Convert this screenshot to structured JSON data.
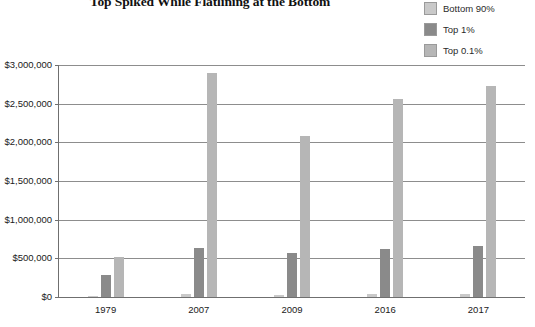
{
  "chart_data": {
    "type": "bar",
    "title": "Top Spiked While Flatlining at the Bottom",
    "xlabel": "",
    "ylabel": "",
    "categories": [
      "1979",
      "2007",
      "2009",
      "2016",
      "2017"
    ],
    "series": [
      {
        "name": "Bottom 90%",
        "color": "#c9c9c9",
        "values": [
          17000,
          34000,
          32000,
          37000,
          39000
        ]
      },
      {
        "name": "Top 1%",
        "color": "#8a8a8a",
        "values": [
          290000,
          630000,
          570000,
          620000,
          660000
        ]
      },
      {
        "name": "Top 0.1%",
        "color": "#b6b6b6",
        "values": [
          520000,
          2900000,
          2080000,
          2560000,
          2730000
        ]
      }
    ],
    "ylim": [
      0,
      3000000
    ],
    "ytick_labels": [
      "$0",
      "$500,000",
      "$1,000,000",
      "$1,500,000",
      "$2,000,000",
      "$2,500,000",
      "$3,000,000"
    ],
    "ytick_values": [
      0,
      500000,
      1000000,
      1500000,
      2000000,
      2500000,
      3000000
    ],
    "grid": true,
    "legend_position": "top-right"
  },
  "legend": {
    "items": [
      {
        "label": "Bottom 90%",
        "color": "#c9c9c9"
      },
      {
        "label": "Top 1%",
        "color": "#8a8a8a"
      },
      {
        "label": "Top 0.1%",
        "color": "#b6b6b6"
      }
    ]
  }
}
